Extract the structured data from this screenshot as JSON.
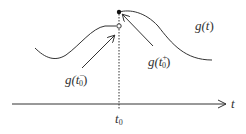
{
  "diagram": {
    "type": "function-discontinuity",
    "labels": {
      "curve": "g(t)",
      "left_limit": "g(t₀⁻)",
      "right_limit": "g(t₀⁺)",
      "axis": "t",
      "tick": "t₀"
    },
    "label_parts": {
      "curve_g": "g(",
      "curve_t": "t",
      "curve_close": ")",
      "left_g": "g(",
      "left_t": "t",
      "left_sub": "0",
      "left_sup": "−",
      "left_close": ")",
      "right_g": "g(",
      "right_t": "t",
      "right_sub": "0",
      "right_sup": "+",
      "right_close": ")",
      "axis_t": "t",
      "tick_t": "t",
      "tick_sub": "0"
    },
    "colors": {
      "stroke": "#333333",
      "background": "#ffffff"
    },
    "points": {
      "filled_dot": {
        "x": 119,
        "y": 12,
        "meaning": "g(t0+)"
      },
      "open_dot": {
        "x": 119,
        "y": 26,
        "meaning": "g(t0-)"
      }
    }
  }
}
